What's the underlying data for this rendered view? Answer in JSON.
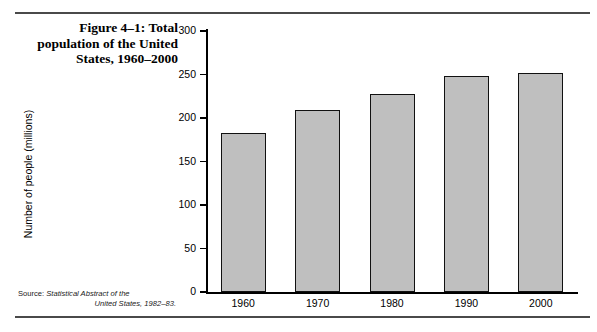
{
  "figure": {
    "caption": "Figure 4–1: Total population of the United States, 1960–2000",
    "source_label": "Source:",
    "source_text_line1": "Statistical Abstract of the",
    "source_text_line2": "United States, 1982–83."
  },
  "chart_data": {
    "type": "bar",
    "title": "Figure 4–1: Total population of the United States, 1960–2000",
    "categories": [
      "1960",
      "1970",
      "1980",
      "1990",
      "2000"
    ],
    "values": [
      183,
      209,
      228,
      248,
      252
    ],
    "xlabel": "",
    "ylabel": "Number of people (millions)",
    "ylim": [
      0,
      300
    ],
    "ytick_values": [
      0,
      50,
      100,
      150,
      200,
      250,
      300
    ],
    "ytick_labels": [
      "0",
      "50",
      "100",
      "150",
      "200",
      "250",
      "300"
    ],
    "grid": false,
    "legend": false,
    "bar_fill_color": "#bfbfbf",
    "bar_edge_color": "#111111",
    "axis_color": "#000000"
  }
}
